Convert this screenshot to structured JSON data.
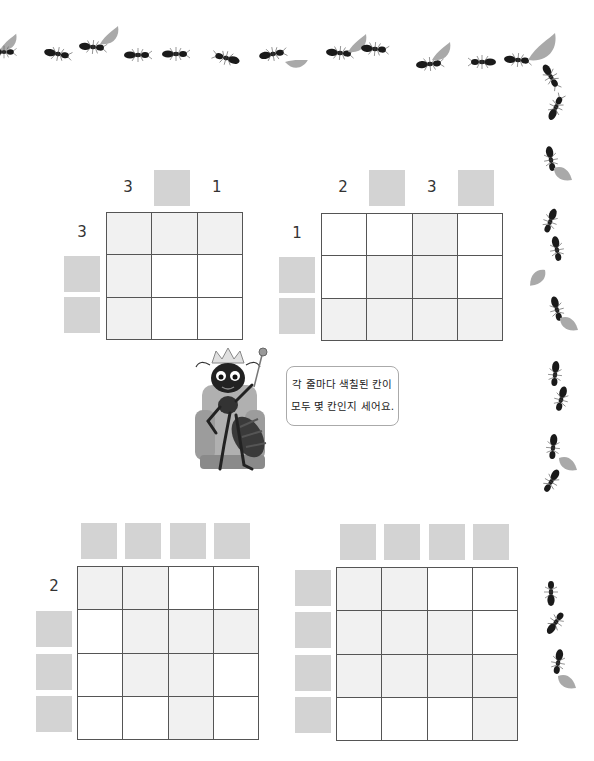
{
  "instruction": {
    "line1": "각 줄마다 색칠된 칸이",
    "line2": "모두 몇 칸인지 세어요."
  },
  "colors": {
    "answer_box": "#d3d3d3",
    "shaded_cell": "#f1f1f1",
    "grid_line": "#555555",
    "ant": "#1a1a1a",
    "leaf": "#a9a9a9"
  },
  "puzzles": [
    {
      "id": 1,
      "rows": 3,
      "cols": 3,
      "col_clues": [
        "3",
        "",
        "1"
      ],
      "row_clues": [
        "3",
        "",
        ""
      ],
      "shaded": [
        [
          1,
          1,
          1
        ],
        [
          1,
          0,
          0
        ],
        [
          1,
          0,
          0
        ]
      ]
    },
    {
      "id": 2,
      "rows": 3,
      "cols": 4,
      "col_clues": [
        "2",
        "",
        "3",
        ""
      ],
      "row_clues": [
        "1",
        "",
        ""
      ],
      "shaded": [
        [
          0,
          0,
          1,
          0
        ],
        [
          0,
          1,
          1,
          0
        ],
        [
          1,
          1,
          1,
          1
        ]
      ]
    },
    {
      "id": 3,
      "rows": 4,
      "cols": 4,
      "col_clues": [
        "",
        "",
        "",
        ""
      ],
      "row_clues": [
        "2",
        "",
        "",
        ""
      ],
      "shaded": [
        [
          1,
          1,
          0,
          0
        ],
        [
          0,
          1,
          1,
          1
        ],
        [
          0,
          1,
          1,
          0
        ],
        [
          0,
          0,
          1,
          0
        ]
      ]
    },
    {
      "id": 4,
      "rows": 4,
      "cols": 4,
      "col_clues": [
        "",
        "",
        "",
        ""
      ],
      "row_clues": [
        "",
        "",
        "",
        ""
      ],
      "shaded": [
        [
          1,
          1,
          0,
          0
        ],
        [
          1,
          1,
          1,
          0
        ],
        [
          1,
          1,
          1,
          1
        ],
        [
          0,
          0,
          0,
          1
        ]
      ]
    }
  ]
}
